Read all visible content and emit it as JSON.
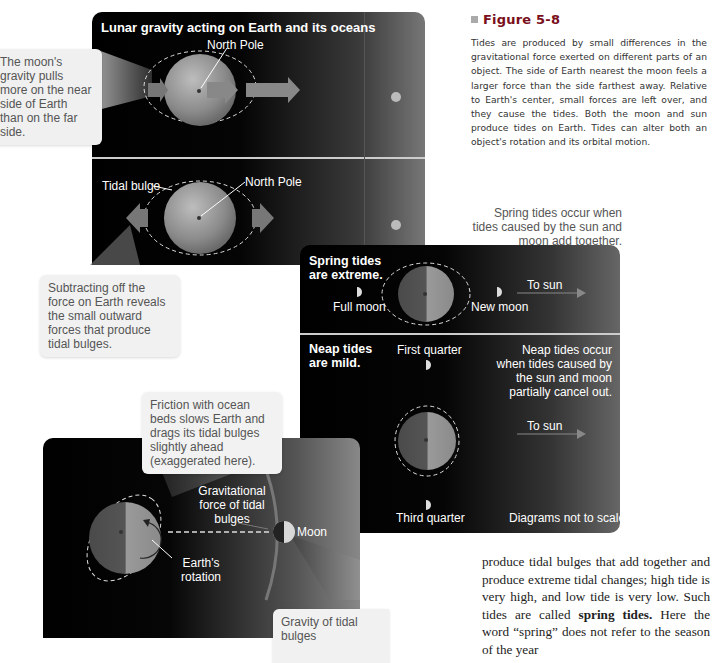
{
  "figure": {
    "number_label": "Figure 5-8",
    "caption": "Tides are produced by small differences in the gravitational force exerted on different parts of an object. The side of Earth nearest the moon feels a larger force than the side farthest away. Relative to Earth's center, small forces are left over, and they cause the tides. Both the moon and sun produce tides on Earth. Tides can alter both an object's rotation and its orbital motion."
  },
  "panel_lunar": {
    "title": "Lunar gravity acting on Earth and its oceans",
    "north_pole_top": "North Pole",
    "callout_top": "The moon's gravity pulls more on the near side of Earth than on the far side.",
    "tidal_bulge": "Tidal bulge",
    "north_pole_bottom": "North Pole",
    "callout_bottom": "Subtracting off the force on Earth reveals the small outward forces that produce tidal bulges."
  },
  "panel_spring_neap": {
    "intro": "Spring tides occur when tides caused by the sun and moon add together.",
    "spring_heading": "Spring tides are extreme.",
    "full_moon": "Full moon",
    "new_moon": "New moon",
    "to_sun_1": "To sun",
    "neap_heading": "Neap tides are mild.",
    "first_quarter": "First quarter",
    "neap_note": "Neap tides occur when tides caused by the sun and moon partially cancel out.",
    "to_sun_2": "To sun",
    "third_quarter": "Third quarter",
    "scale_note": "Diagrams not to scale"
  },
  "panel_friction": {
    "callout_top": "Friction with ocean beds slows Earth and drags its tidal bulges slightly ahead (exaggerated here).",
    "grav_force": "Gravitational force of tidal bulges",
    "moon": "Moon",
    "earth_rotation": "Earth's rotation",
    "callout_bottom": "Gravity of tidal bulges"
  },
  "body": {
    "text_before": "produce tidal bulges that add together and produce extreme tidal changes; high tide is very high, and low tide is very low. Such tides are called ",
    "bold_term": "spring tides.",
    "text_after": " Here the word “spring” does not refer to the season of the year"
  }
}
